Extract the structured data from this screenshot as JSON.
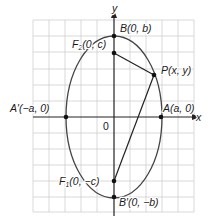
{
  "diagram": {
    "type": "ellipse-vertical-major-axis",
    "colors": {
      "grid": "#c8c8c8",
      "axis": "#222222",
      "ellipse": "#444444",
      "segment": "#222222",
      "point": "#111111",
      "text": "#1a1a1a"
    },
    "axes": {
      "x_label": "x",
      "y_label": "y",
      "origin_label": "0"
    },
    "points": {
      "B": {
        "name": "B",
        "label": "B(0, b)"
      },
      "B_prime": {
        "name": "B′",
        "label": "B′(0, −b)"
      },
      "A": {
        "name": "A",
        "label": "A(a, 0)"
      },
      "A_prime": {
        "name": "A′",
        "label": "A′(−a, 0)"
      },
      "F2": {
        "name": "F₂",
        "label_main": "F",
        "label_sub": "2",
        "label_rest": "(0, c)"
      },
      "F1": {
        "name": "F₁",
        "label_main": "F",
        "label_sub": "1",
        "label_rest": "(0, −c)"
      },
      "P": {
        "name": "P",
        "label": "P(x, y)"
      }
    },
    "segments": [
      {
        "from": "F2",
        "to": "P"
      },
      {
        "from": "P",
        "to": "F1"
      }
    ]
  }
}
